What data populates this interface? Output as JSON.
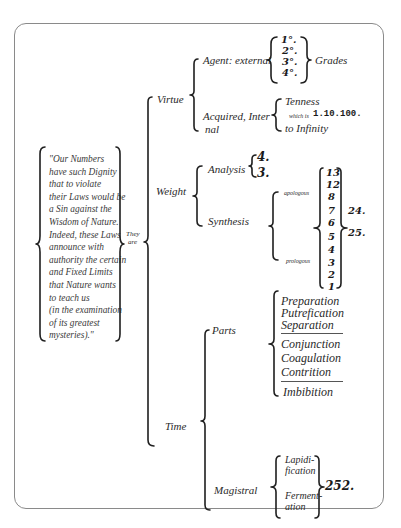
{
  "diagram": {
    "quote": {
      "lines": [
        "\"Our Numbers",
        " have such Dignity",
        " that to violate",
        "their Laws would be",
        " a Sin against the",
        "Wisdom of Nature.",
        "Indeed, these Laws",
        " announce with",
        "authority the certain",
        " and Fixed Limits",
        "that Nature wants",
        " to teach us",
        " (in the examination",
        "  of its greatest",
        "mysteries).\""
      ]
    },
    "connector": {
      "line1": "They",
      "line2": "are"
    },
    "virtue": {
      "label": "Virtue",
      "agent": {
        "label": "Agent: external",
        "grades": [
          "1°.",
          "2°.",
          "3°.",
          "4°."
        ],
        "result": "Grades"
      },
      "acquired": {
        "label_line1": "Acquired, Inter",
        "label_line2": "nal",
        "tenness": "Tenness",
        "which_is": "which is",
        "sequence": "1.10.100.",
        "infinity": "to Infinity"
      }
    },
    "weight": {
      "label": "Weight",
      "analysis": {
        "label": "Analysis",
        "values": [
          "4.",
          "3."
        ]
      },
      "synthesis": {
        "label": "Synthesis",
        "upper": "apologous",
        "lower": "prologous",
        "numbers": [
          "13",
          "12",
          "8",
          "7",
          "6",
          "5",
          "4",
          "3",
          "2",
          "1"
        ],
        "sum_upper": "24.",
        "sum_lower": "25."
      }
    },
    "time": {
      "label": "Time",
      "parts": {
        "label": "Parts",
        "group1": [
          "Preparation",
          "Putrefication",
          "Separation"
        ],
        "group2": [
          "Conjunction",
          "Coagulation",
          "Contrition"
        ],
        "group3": [
          "Imbibition"
        ]
      },
      "magistral": {
        "label": "Magistral",
        "items": [
          {
            "line1": "Lapidi-",
            "line2": "fication"
          },
          {
            "line1": "Ferment-",
            "line2": "ation"
          }
        ],
        "total": "252."
      }
    }
  }
}
